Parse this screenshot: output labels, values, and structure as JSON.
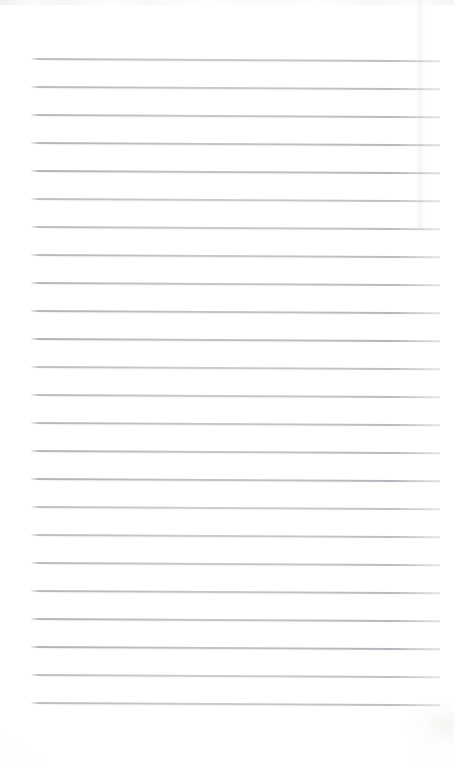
{
  "document": {
    "type": "scanned-lined-paper",
    "title": "Scanned Lined Notebook Page",
    "description": "A blank scanned sheet of ruled notebook paper with no handwriting or printed text.",
    "page_width_px": 454,
    "page_height_px": 764,
    "background_color": "#ffffff",
    "rule_line_color": "#b4b8bd",
    "rule_line_count": 24,
    "first_line_y_px": 58,
    "last_line_y_px": 702,
    "line_spacing_px": 28,
    "line_left_x_px": 31,
    "line_right_x_px": 440,
    "line_thickness_px": 1.6,
    "skew_deg": 0.32,
    "top_margin_px": 58,
    "bottom_margin_px": 62,
    "visible_text": "",
    "artifacts": {
      "top_scan_band": "faint gray banding along the top edge",
      "right_sheet_edge": "soft vertical shadow near the right side of the upper page",
      "bottom_right_smudge": "faint warm smudge at the lower right corner"
    },
    "rule_lines": [
      {
        "index": 1,
        "y": 58
      },
      {
        "index": 2,
        "y": 86
      },
      {
        "index": 3,
        "y": 114
      },
      {
        "index": 4,
        "y": 142
      },
      {
        "index": 5,
        "y": 170
      },
      {
        "index": 6,
        "y": 198
      },
      {
        "index": 7,
        "y": 226
      },
      {
        "index": 8,
        "y": 254
      },
      {
        "index": 9,
        "y": 282
      },
      {
        "index": 10,
        "y": 310
      },
      {
        "index": 11,
        "y": 338
      },
      {
        "index": 12,
        "y": 366
      },
      {
        "index": 13,
        "y": 394
      },
      {
        "index": 14,
        "y": 422
      },
      {
        "index": 15,
        "y": 450
      },
      {
        "index": 16,
        "y": 478
      },
      {
        "index": 17,
        "y": 506
      },
      {
        "index": 18,
        "y": 534
      },
      {
        "index": 19,
        "y": 562
      },
      {
        "index": 20,
        "y": 590
      },
      {
        "index": 21,
        "y": 618
      },
      {
        "index": 22,
        "y": 646
      },
      {
        "index": 23,
        "y": 674
      },
      {
        "index": 24,
        "y": 702
      }
    ]
  }
}
